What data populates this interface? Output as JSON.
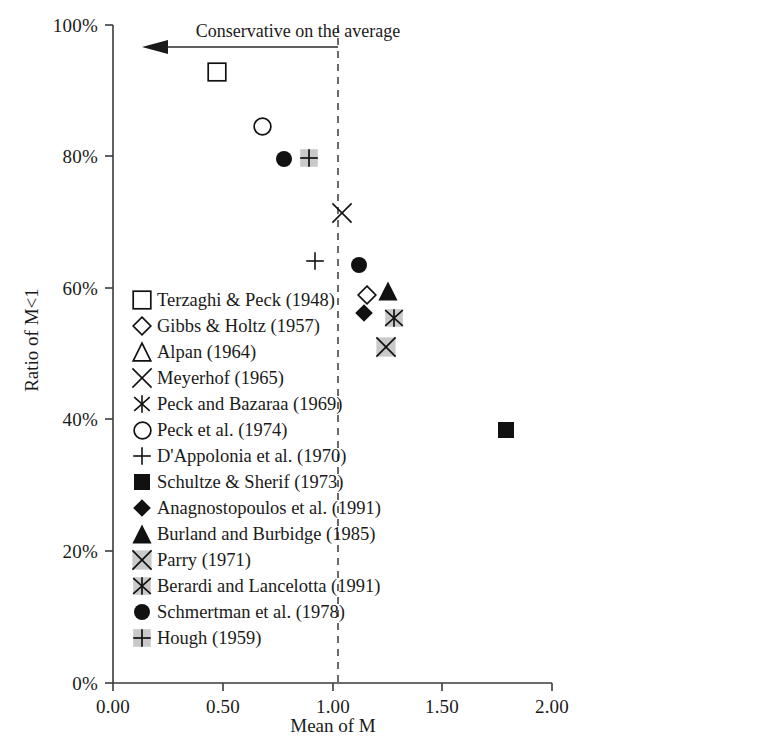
{
  "chart_data": {
    "type": "scatter",
    "title": "",
    "xlabel": "Mean of M",
    "ylabel": "Ratio of M<1",
    "xlim": [
      0.0,
      2.0
    ],
    "ylim": [
      0,
      100
    ],
    "x_ticks": [
      "0.00",
      "0.50",
      "1.00",
      "1.50",
      "2.00"
    ],
    "x_tick_values": [
      0.0,
      0.5,
      1.0,
      1.5,
      2.0
    ],
    "y_ticks": [
      "0%",
      "20%",
      "40%",
      "60%",
      "80%",
      "100%"
    ],
    "y_tick_values": [
      0,
      20,
      40,
      60,
      80,
      100
    ],
    "grid": false,
    "legend_position": "inside-left",
    "annotations": [
      {
        "text": "Conservative on the average",
        "arrow": "left",
        "arrow_from_x": 1.02,
        "arrow_to_x": 0.13,
        "arrow_y": 94.5
      }
    ],
    "reference_lines": [
      {
        "orientation": "vertical",
        "value": 1.02,
        "style": "dashed"
      }
    ],
    "series": [
      {
        "name": "Terzaghi & Peck (1948)",
        "marker": "square-open",
        "x": 0.475,
        "y": 92.8
      },
      {
        "name": "Gibbs & Holtz (1957)",
        "marker": "diamond-open",
        "x": 1.155,
        "y": 59.0
      },
      {
        "name": "Alpan (1964)",
        "marker": "triangle-open",
        "x": null,
        "y": null
      },
      {
        "name": "Meyerhof (1965)",
        "marker": "x-thin",
        "x": 1.045,
        "y": 71.4
      },
      {
        "name": "Peck and Bazaraa (1969)",
        "marker": "asterisk",
        "x": null,
        "y": null
      },
      {
        "name": "Peck et al. (1974)",
        "marker": "circle-open",
        "x": 0.68,
        "y": 84.5
      },
      {
        "name": "D'Appolonia et al. (1970)",
        "marker": "plus",
        "x": 0.92,
        "y": 64.1
      },
      {
        "name": "Schultze & Sherif (1973)",
        "marker": "square-fill",
        "x": 1.79,
        "y": 38.5
      },
      {
        "name": "Anagnostopoulos et al. (1991)",
        "marker": "diamond-fill",
        "x": 1.145,
        "y": 56.2
      },
      {
        "name": "Burland and Burbidge (1985)",
        "marker": "triangle-fill",
        "x": 1.255,
        "y": 59.5
      },
      {
        "name": "Parry (1971)",
        "marker": "x-box-gray",
        "x": 1.245,
        "y": 51.0
      },
      {
        "name": "Berardi and Lancelotta (1991)",
        "marker": "star-box-gray",
        "x": 1.28,
        "y": 55.5
      },
      {
        "name": "Schmertman et al. (1978)",
        "marker": "circle-fill",
        "x": 1.12,
        "y": 63.5
      },
      {
        "name": "Hough (1959)",
        "marker": "plus-box-gray",
        "x": 0.895,
        "y": 79.8
      }
    ],
    "extra_points": [
      {
        "marker": "circle-fill",
        "label": "Schmertman et al. (1978)",
        "x": 0.78,
        "y": 79.6
      }
    ]
  },
  "legend": {
    "items": [
      {
        "marker": "square-open",
        "label": "Terzaghi & Peck (1948)"
      },
      {
        "marker": "diamond-open",
        "label": "Gibbs & Holtz (1957)"
      },
      {
        "marker": "triangle-open",
        "label": "Alpan (1964)"
      },
      {
        "marker": "x-thin",
        "label": "Meyerhof (1965)"
      },
      {
        "marker": "asterisk",
        "label": "Peck and Bazaraa (1969)"
      },
      {
        "marker": "circle-open",
        "label": "Peck et al. (1974)"
      },
      {
        "marker": "plus",
        "label": "D'Appolonia et al. (1970)"
      },
      {
        "marker": "square-fill",
        "label": "Schultze & Sherif (1973)"
      },
      {
        "marker": "diamond-fill",
        "label": "Anagnostopoulos et al. (1991)"
      },
      {
        "marker": "triangle-fill",
        "label": "Burland and Burbidge (1985)"
      },
      {
        "marker": "x-box-gray",
        "label": "Parry (1971)"
      },
      {
        "marker": "star-box-gray",
        "label": "Berardi and Lancelotta (1991)"
      },
      {
        "marker": "circle-fill",
        "label": "Schmertman et al. (1978)"
      },
      {
        "marker": "plus-box-gray",
        "label": "Hough (1959)"
      }
    ]
  },
  "colors": {
    "axis": "#3a3a3a",
    "marker_dark": "#111111",
    "marker_gray_fill": "#c9c9c9",
    "text": "#1a1a1a",
    "background": "#ffffff"
  }
}
